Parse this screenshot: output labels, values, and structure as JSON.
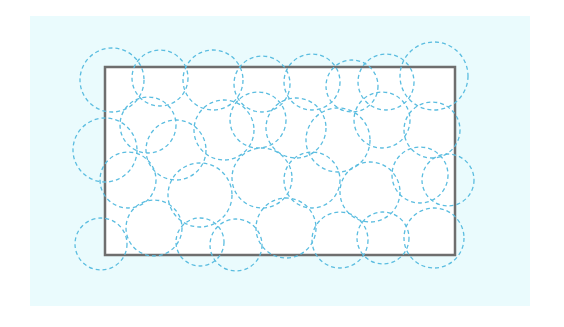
{
  "diagram": {
    "type": "circle-coverage",
    "background_color": "#eafbfd",
    "region": {
      "shape": "rectangle",
      "x": 105,
      "y": 67,
      "width": 350,
      "height": 188,
      "fill": "#ffffff",
      "stroke": "#6e6e6e",
      "stroke_width": 2.5
    },
    "circle_style": {
      "stroke": "#5bbde0",
      "stroke_width": 1.3,
      "dasharray": "4 3",
      "fill": "none"
    },
    "circles": [
      {
        "cx": 112,
        "cy": 80,
        "r": 32
      },
      {
        "cx": 160,
        "cy": 78,
        "r": 28
      },
      {
        "cx": 213,
        "cy": 80,
        "r": 30
      },
      {
        "cx": 262,
        "cy": 84,
        "r": 28
      },
      {
        "cx": 312,
        "cy": 82,
        "r": 28
      },
      {
        "cx": 352,
        "cy": 86,
        "r": 26
      },
      {
        "cx": 386,
        "cy": 82,
        "r": 28
      },
      {
        "cx": 434,
        "cy": 76,
        "r": 34
      },
      {
        "cx": 105,
        "cy": 150,
        "r": 32
      },
      {
        "cx": 148,
        "cy": 125,
        "r": 28
      },
      {
        "cx": 176,
        "cy": 150,
        "r": 30
      },
      {
        "cx": 224,
        "cy": 130,
        "r": 30
      },
      {
        "cx": 258,
        "cy": 120,
        "r": 28
      },
      {
        "cx": 296,
        "cy": 128,
        "r": 30
      },
      {
        "cx": 338,
        "cy": 140,
        "r": 32
      },
      {
        "cx": 382,
        "cy": 120,
        "r": 28
      },
      {
        "cx": 432,
        "cy": 130,
        "r": 28
      },
      {
        "cx": 448,
        "cy": 180,
        "r": 26
      },
      {
        "cx": 128,
        "cy": 180,
        "r": 28
      },
      {
        "cx": 200,
        "cy": 195,
        "r": 32
      },
      {
        "cx": 262,
        "cy": 178,
        "r": 30
      },
      {
        "cx": 312,
        "cy": 180,
        "r": 28
      },
      {
        "cx": 370,
        "cy": 192,
        "r": 30
      },
      {
        "cx": 420,
        "cy": 175,
        "r": 28
      },
      {
        "cx": 101,
        "cy": 244,
        "r": 26
      },
      {
        "cx": 154,
        "cy": 228,
        "r": 28
      },
      {
        "cx": 200,
        "cy": 242,
        "r": 24
      },
      {
        "cx": 236,
        "cy": 245,
        "r": 26
      },
      {
        "cx": 286,
        "cy": 228,
        "r": 30
      },
      {
        "cx": 340,
        "cy": 240,
        "r": 28
      },
      {
        "cx": 383,
        "cy": 238,
        "r": 26
      },
      {
        "cx": 434,
        "cy": 238,
        "r": 30
      }
    ]
  }
}
